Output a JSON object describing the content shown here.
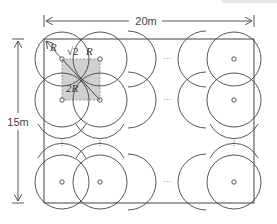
{
  "diagram": {
    "width_label": "20m",
    "height_label": "15m",
    "radius_label": "R",
    "side_label_prefix": "√2",
    "side_label_var": "R",
    "diagonal_label": "2R",
    "ellipsis_horizontal": "···",
    "ellipsis_vertical": "⋮",
    "colors": {
      "line": "#444444",
      "shaded_square": "#d0d0d0",
      "dashed": "#888888",
      "top_bar": "#e6e6e6"
    },
    "room": {
      "x": 44,
      "y": 39,
      "w": 210,
      "h": 164
    },
    "circle_radius": 27,
    "columns_x": [
      62,
      100,
      234
    ],
    "rows_y": [
      59,
      100,
      182
    ]
  }
}
